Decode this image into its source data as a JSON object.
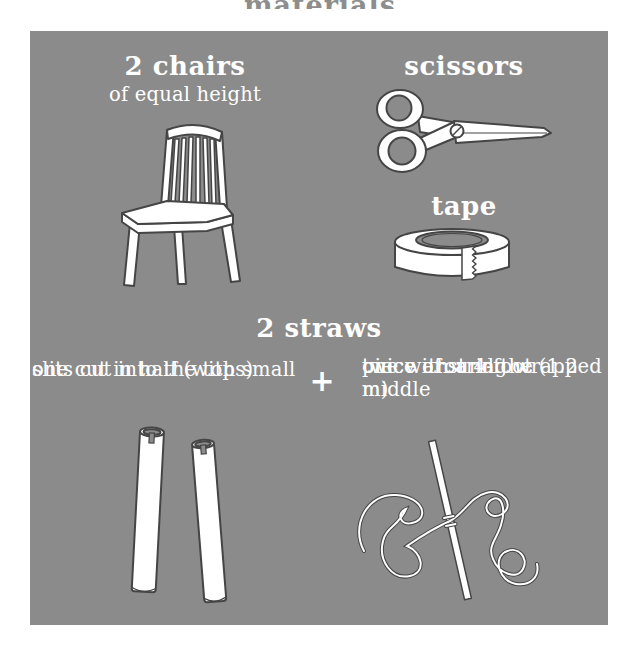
{
  "page": {
    "top_title": "materials"
  },
  "colors": {
    "panel_bg": "#8b8b8b",
    "text": "#ffffff",
    "illustration_outline": "#454545",
    "top_title_color": "#8d8d8d"
  },
  "sections": {
    "chairs": {
      "title": "2 chairs",
      "subtitle": "of equal height",
      "icon": "chair-icon"
    },
    "scissors": {
      "title": "scissors",
      "icon": "scissors-icon"
    },
    "tape": {
      "title": "tape",
      "icon": "tape-icon"
    },
    "straws": {
      "title": "2 straws",
      "left_caption_lines": [
        "one cut in half (with small",
        "slits cut into the tops)"
      ],
      "plus": "+",
      "right_caption_lines": [
        "one with a 4-foot (1.2 m)",
        "piece of string wrapped",
        "twice around the middle"
      ],
      "left_icon": "straw-halves-icon",
      "right_icon": "straw-string-icon"
    }
  }
}
